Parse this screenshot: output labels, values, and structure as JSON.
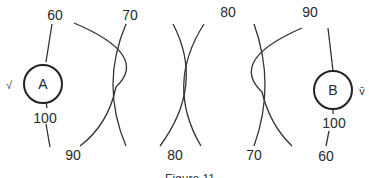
{
  "diagram": {
    "source_a": {
      "label": "A",
      "side_label": "√"
    },
    "source_b": {
      "label": "B",
      "side_label": "v̄"
    },
    "top_labels": [
      "60",
      "70",
      "80",
      "90"
    ],
    "bottom_labels": [
      "90",
      "80",
      "70",
      "60"
    ],
    "a_lower_label": "100",
    "b_lower_label": "100",
    "caption": "Figure 11"
  }
}
